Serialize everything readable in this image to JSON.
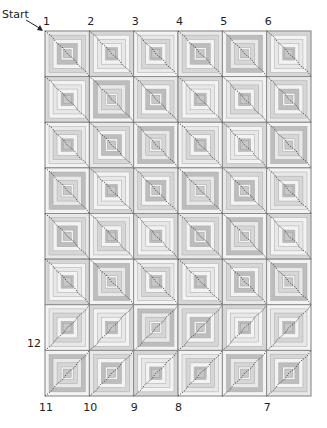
{
  "diagram": {
    "start_label": "Start",
    "grid": {
      "columns": 6,
      "rows": 8
    },
    "colors": {
      "block_border": "#8a8a8a",
      "light": "#f3f3f3",
      "light2": "#e8e8e8",
      "mid": "#d6d6d6",
      "dark": "#bdbdbd",
      "center": "#c8c8c8",
      "path": "#333333",
      "label": "#222222"
    },
    "path_direction_by_row": [
      "descending",
      "descending",
      "descending",
      "descending",
      "descending",
      "descending",
      "ascending",
      "ascending"
    ],
    "top_labels": [
      {
        "text": "1",
        "col_edge": 0
      },
      {
        "text": "2",
        "col_edge": 1
      },
      {
        "text": "3",
        "col_edge": 2
      },
      {
        "text": "4",
        "col_edge": 3
      },
      {
        "text": "5",
        "col_edge": 4
      },
      {
        "text": "6",
        "col_edge": 5
      }
    ],
    "bottom_labels": [
      {
        "text": "11",
        "col_edge": 0
      },
      {
        "text": "10",
        "col_edge": 1
      },
      {
        "text": "9",
        "col_edge": 2
      },
      {
        "text": "8",
        "col_edge": 3
      },
      {
        "text": "7",
        "col_edge": 5
      }
    ],
    "side_labels": [
      {
        "text": "12",
        "row_edge": 7
      }
    ],
    "block_shades": [
      [
        1,
        2,
        0,
        1,
        3,
        2
      ],
      [
        2,
        3,
        1,
        2,
        0,
        1
      ],
      [
        0,
        1,
        3,
        0,
        2,
        3
      ],
      [
        3,
        2,
        1,
        3,
        1,
        0
      ],
      [
        1,
        0,
        2,
        1,
        3,
        2
      ],
      [
        2,
        3,
        0,
        2,
        1,
        3
      ],
      [
        0,
        2,
        3,
        1,
        2,
        0
      ],
      [
        3,
        1,
        2,
        0,
        3,
        1
      ]
    ]
  }
}
